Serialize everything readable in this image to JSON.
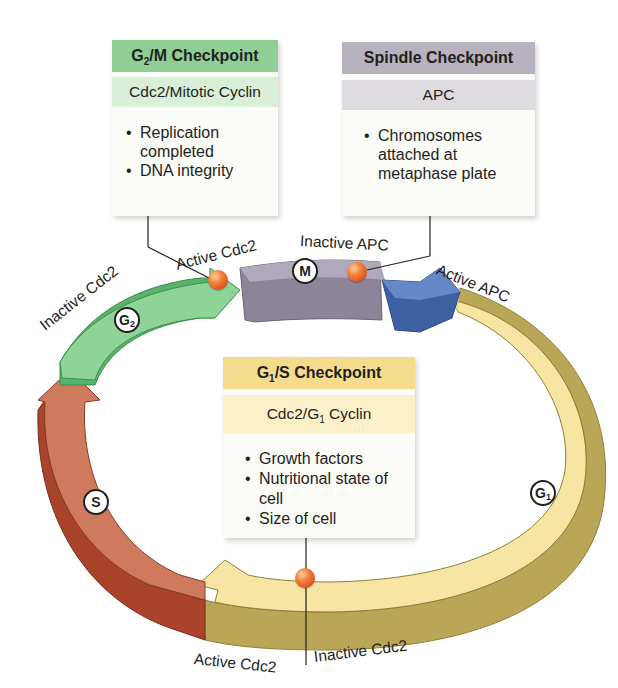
{
  "checkpoints": {
    "g2m": {
      "title_main": "G",
      "title_sub": "2",
      "title_rest": "/M Checkpoint",
      "regulator": "Cdc2/Mitotic Cyclin",
      "conditions": [
        "Replication completed",
        "DNA integrity"
      ],
      "header_color": "#8fcf95",
      "regulator_color": "#d9efd8"
    },
    "spindle": {
      "title": "Spindle Checkpoint",
      "regulator": "APC",
      "conditions": [
        "Chromosomes attached at metaphase plate"
      ],
      "header_color": "#b7b2bd",
      "regulator_color": "#dedbe0"
    },
    "g1s": {
      "title_main": "G",
      "title_sub": "1",
      "title_rest": "/S Checkpoint",
      "regulator_main": "Cdc2/G",
      "regulator_sub": "1",
      "regulator_rest": " Cyclin",
      "conditions": [
        "Growth factors",
        "Nutritional state of cell",
        "Size of cell"
      ],
      "header_color": "#f5dc8c",
      "regulator_color": "#fbf0c8"
    }
  },
  "phases": {
    "g2": {
      "main": "G",
      "sub": "2",
      "color": "#7cc886"
    },
    "m": {
      "main": "M",
      "color": "#9b93a9"
    },
    "s": {
      "main": "S",
      "color": "#c96b4f"
    },
    "g1": {
      "main": "G",
      "sub": "1",
      "color": "#f3e3a0"
    },
    "apc": {
      "color": "#4a6fb0"
    }
  },
  "labels": {
    "inactive_cdc2_top": "Inactive Cdc2",
    "active_cdc2_top": "Active Cdc2",
    "inactive_apc": "Inactive APC",
    "active_apc": "Active APC",
    "active_cdc2_bottom": "Active Cdc2",
    "inactive_cdc2_bottom": "Inactive Cdc2"
  }
}
